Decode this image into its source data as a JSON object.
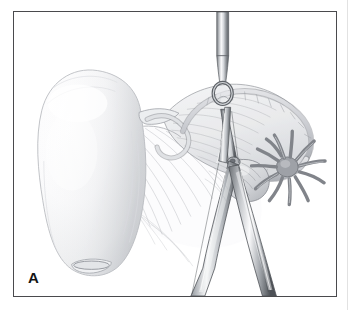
{
  "figure": {
    "panel_label": "A",
    "kind": "medical-illustration",
    "frame": {
      "border_color": "#4a4a4d",
      "background_color": "#ffffff",
      "gutter_line_color": "#e2e2e2"
    },
    "palette": {
      "ink_outline": "#6e7076",
      "ink_outline_dark": "#4f5257",
      "tissue_fill_light": "#fbfbfc",
      "tissue_fill_mid": "#e7e8ea",
      "tissue_fill_shadow": "#c9cbcf",
      "instrument_metal_light": "#f2f3f4",
      "instrument_metal_mid": "#9b9ea3",
      "instrument_metal_dark": "#5c6065",
      "hatch_line": "#b6b8bd",
      "label_text": "#141414"
    },
    "structures": [
      {
        "name": "uterus",
        "description": "Large pear-shaped uterine body, left of center, smooth pale gradient shading"
      },
      {
        "name": "cervix",
        "description": "Narrow rounded lower pole of uterus with small oval external os"
      },
      {
        "name": "broad-ligament",
        "description": "Fan of fine parallel hatch lines spreading below and right of the uterus"
      },
      {
        "name": "fallopian-tube",
        "description": "Coiled tube arching across the upper right, grasped at its midpoint"
      },
      {
        "name": "mesosalpinx",
        "description": "Translucent membranous sheet beneath the fallopian tube, finely striated"
      },
      {
        "name": "ovary",
        "description": "Small ovoid body lying below the tube, right of the clamp jaws"
      },
      {
        "name": "fimbriae",
        "description": "Star-burst of finger-like projections at the distal tube end, far right"
      }
    ],
    "instruments": [
      {
        "name": "ring-forceps",
        "description": "Vertical forceps descending from the top with an oval ring tip encircling the tube"
      },
      {
        "name": "hemostat-clamp",
        "description": "Long curved clamp with two crossing jaws meeting at a box-lock pivot, running from upper center to lower right"
      }
    ]
  }
}
